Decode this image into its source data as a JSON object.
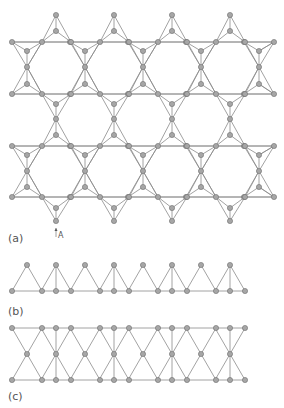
{
  "figure": {
    "style": {
      "line_color": "#8a8a8a",
      "node_fill": "#a6a6a6",
      "node_stroke": "#6e6e6e",
      "node_radius": 2.6,
      "label_color": "#555555"
    },
    "panels": [
      {
        "id": "a",
        "label": "(a)",
        "label_pos": [
          8,
          232
        ]
      },
      {
        "id": "b",
        "label": "(b)",
        "label_pos": [
          8,
          305
        ]
      },
      {
        "id": "c",
        "label": "(c)",
        "label_pos": [
          8,
          390
        ]
      }
    ],
    "annotation": {
      "text": "A",
      "arrow_x": 56,
      "arrow_y1": 237,
      "arrow_y2": 228,
      "text_pos": [
        58,
        231
      ]
    },
    "lattice_a": {
      "row_xs": [
        12,
        42,
        71,
        100,
        129,
        158,
        187,
        216,
        245,
        274
      ],
      "bands": [
        {
          "top": 42,
          "mid": 67,
          "bottom": 94
        },
        {
          "top": 146,
          "mid": 171,
          "bottom": 197
        }
      ],
      "column_xs": [
        27,
        85,
        143,
        201,
        259
      ],
      "apex_xs": [
        56,
        114,
        172,
        230
      ],
      "top_apex": {
        "outer": 15,
        "inner": 31
      },
      "between": {
        "inner_down": 104,
        "center": 119,
        "inner_up": 135
      },
      "bottom_apex": {
        "inner": 208,
        "outer": 221
      }
    },
    "strip_b": {
      "apex_y": 265,
      "base_y": 291,
      "apex_xs": [
        27,
        56,
        85,
        114,
        143,
        172,
        201,
        230
      ],
      "base_xs": [
        12,
        42,
        56,
        71,
        100,
        114,
        129,
        158,
        172,
        187,
        216,
        230,
        245
      ]
    },
    "strip_c": {
      "top_y": 328,
      "mid_y": 354,
      "bottom_y": 380,
      "mid_xs": [
        27,
        56,
        85,
        114,
        143,
        172,
        201,
        230
      ],
      "edge_xs": [
        12,
        42,
        56,
        71,
        100,
        114,
        129,
        158,
        172,
        187,
        216,
        230,
        245
      ]
    }
  }
}
